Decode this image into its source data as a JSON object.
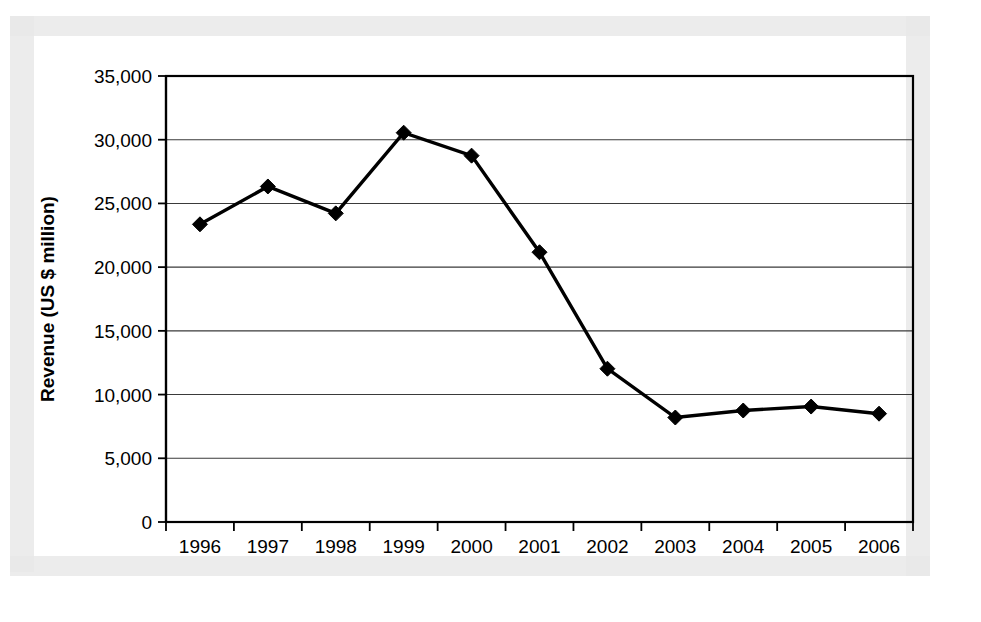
{
  "page": {
    "background_color": "#ffffff",
    "scan_border_color": "#e9e9e9"
  },
  "chart_data": {
    "type": "line",
    "title": "",
    "subtitle": "",
    "xlabel": "",
    "ylabel": "Revenue (US $ million)",
    "categories": [
      "1996",
      "1997",
      "1998",
      "1999",
      "2000",
      "2001",
      "2002",
      "2003",
      "2004",
      "2005",
      "2006"
    ],
    "values": [
      23360,
      26330,
      24220,
      30550,
      28750,
      21170,
      12030,
      8200,
      8750,
      9060,
      8500
    ],
    "series": [
      {
        "name": "Revenue",
        "values": [
          23360,
          26330,
          24220,
          30550,
          28750,
          21170,
          12030,
          8200,
          8750,
          9060,
          8500
        ],
        "line_color": "#000000",
        "marker": "diamond",
        "marker_color": "#000000"
      }
    ],
    "ylim": [
      0,
      35000
    ],
    "ytick_values": [
      0,
      5000,
      10000,
      15000,
      20000,
      25000,
      30000,
      35000
    ],
    "ytick_labels": [
      "0",
      "5,000",
      "10,000",
      "15,000",
      "20,000",
      "25,000",
      "30,000",
      "35,000"
    ],
    "xtick_labels": [
      "1996",
      "1997",
      "1998",
      "1999",
      "2000",
      "2001",
      "2002",
      "2003",
      "2004",
      "2005",
      "2006"
    ],
    "grid": "horizontal",
    "legend": "none",
    "legend_position": "none",
    "annotations": []
  }
}
